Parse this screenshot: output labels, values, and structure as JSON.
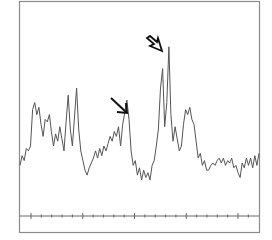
{
  "chart_data": {
    "type": "line",
    "title": "",
    "xlabel": "",
    "ylabel": "",
    "grid": false,
    "legend": null,
    "xlim": [
      0,
      100
    ],
    "ylim": [
      0,
      100
    ],
    "x_major_ticks": [
      0,
      25,
      50,
      75,
      100
    ],
    "x_minor_ticks_per_major": 4,
    "tick_labels": [],
    "series": [
      {
        "name": "spectrum",
        "color": "#555555",
        "points": [
          [
            0,
            30
          ],
          [
            1,
            34
          ],
          [
            2,
            32
          ],
          [
            3,
            37
          ],
          [
            4,
            36
          ],
          [
            5,
            38
          ],
          [
            6,
            53
          ],
          [
            7,
            56
          ],
          [
            8,
            51
          ],
          [
            9,
            54
          ],
          [
            10,
            47
          ],
          [
            11,
            42
          ],
          [
            12,
            49
          ],
          [
            13,
            48
          ],
          [
            14,
            51
          ],
          [
            15,
            44
          ],
          [
            16,
            38
          ],
          [
            17,
            43
          ],
          [
            18,
            40
          ],
          [
            19,
            46
          ],
          [
            20,
            41
          ],
          [
            21,
            36
          ],
          [
            22,
            48
          ],
          [
            23,
            59
          ],
          [
            24,
            45
          ],
          [
            25,
            38
          ],
          [
            26,
            50
          ],
          [
            27,
            62
          ],
          [
            28,
            45
          ],
          [
            29,
            36
          ],
          [
            30,
            32
          ],
          [
            31,
            28
          ],
          [
            32,
            26
          ],
          [
            33,
            29
          ],
          [
            34,
            31
          ],
          [
            35,
            33
          ],
          [
            36,
            36
          ],
          [
            37,
            33
          ],
          [
            38,
            37
          ],
          [
            39,
            34
          ],
          [
            40,
            38
          ],
          [
            41,
            36
          ],
          [
            42,
            39
          ],
          [
            43,
            42
          ],
          [
            44,
            40
          ],
          [
            45,
            44
          ],
          [
            46,
            42
          ],
          [
            47,
            46
          ],
          [
            48,
            38
          ],
          [
            49,
            47
          ],
          [
            50,
            52
          ],
          [
            51,
            57
          ],
          [
            52,
            49
          ],
          [
            53,
            36
          ],
          [
            54,
            30
          ],
          [
            55,
            32
          ],
          [
            56,
            26
          ],
          [
            57,
            29
          ],
          [
            58,
            24
          ],
          [
            59,
            28
          ],
          [
            60,
            25
          ],
          [
            61,
            27
          ],
          [
            62,
            24
          ],
          [
            63,
            30
          ],
          [
            64,
            32
          ],
          [
            65,
            38
          ],
          [
            66,
            45
          ],
          [
            67,
            62
          ],
          [
            68,
            70
          ],
          [
            69,
            46
          ],
          [
            70,
            56
          ],
          [
            71,
            79
          ],
          [
            72,
            51
          ],
          [
            73,
            40
          ],
          [
            74,
            46
          ],
          [
            75,
            41
          ],
          [
            76,
            36
          ],
          [
            77,
            38
          ],
          [
            78,
            47
          ],
          [
            79,
            53
          ],
          [
            80,
            51
          ],
          [
            81,
            54
          ],
          [
            82,
            49
          ],
          [
            83,
            47
          ],
          [
            84,
            40
          ],
          [
            85,
            33
          ],
          [
            86,
            35
          ],
          [
            87,
            30
          ],
          [
            88,
            32
          ],
          [
            89,
            28
          ],
          [
            90,
            28
          ],
          [
            91,
            30
          ],
          [
            92,
            31
          ],
          [
            93,
            30
          ],
          [
            94,
            32
          ],
          [
            95,
            33
          ],
          [
            96,
            31
          ],
          [
            97,
            33
          ],
          [
            98,
            30
          ],
          [
            99,
            32
          ],
          [
            100,
            31
          ],
          [
            101,
            33
          ],
          [
            102,
            29
          ],
          [
            103,
            30
          ],
          [
            104,
            27
          ],
          [
            105,
            25
          ],
          [
            106,
            31
          ],
          [
            107,
            29
          ],
          [
            108,
            33
          ],
          [
            109,
            30
          ],
          [
            110,
            33
          ],
          [
            111,
            29
          ],
          [
            112,
            34
          ],
          [
            113,
            30
          ],
          [
            114,
            35
          ]
        ]
      }
    ],
    "annotations": [
      {
        "type": "arrow",
        "style": "solid",
        "target_x": 52,
        "target_y": 57,
        "label": "",
        "from": "upper-left"
      },
      {
        "type": "arrow",
        "style": "open-hollow",
        "target_x": 70,
        "target_y": 75,
        "label": "",
        "from": "upper-left"
      }
    ]
  },
  "frame": {
    "border_color": "#8a8a8a",
    "axis_color": "#666666",
    "line_color": "#555555",
    "arrow_color": "#111111"
  }
}
